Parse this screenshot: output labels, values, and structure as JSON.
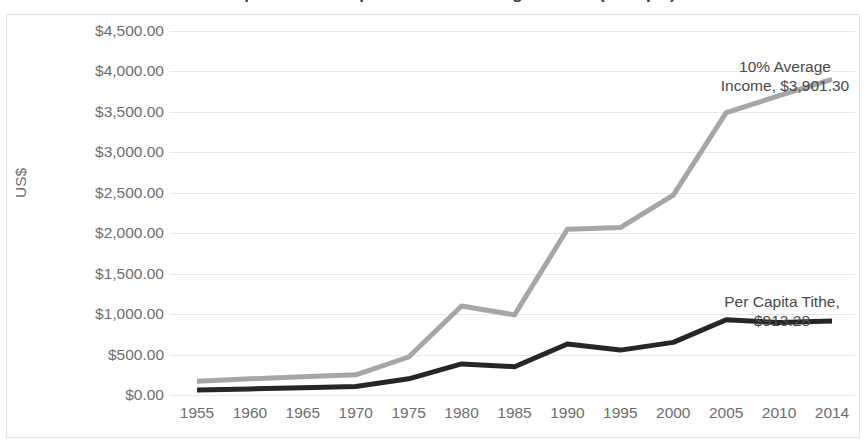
{
  "chart_data": {
    "type": "line",
    "title": "Per Capita Tithe Compared to 10% Average Income (Ethiopia)",
    "xlabel": "",
    "ylabel": "US$",
    "ylim": [
      0,
      4500
    ],
    "ytick_step": 500,
    "grid": true,
    "legend": "none",
    "categories": [
      "1955",
      "1960",
      "1965",
      "1970",
      "1975",
      "1980",
      "1985",
      "1990",
      "1995",
      "2000",
      "2005",
      "2010",
      "2014"
    ],
    "ytick_labels": [
      "$4,500.00",
      "$4,000.00",
      "$3,500.00",
      "$3,000.00",
      "$2,500.00",
      "$2,000.00",
      "$1,500.00",
      "$1,000.00",
      "$500.00",
      "$0.00"
    ],
    "ytick_values": [
      4500,
      4000,
      3500,
      3000,
      2500,
      2000,
      1500,
      1000,
      500,
      0
    ],
    "series": [
      {
        "name": "10% Average Income",
        "color": "#a6a6a6",
        "width": 5,
        "values": [
          170,
          200,
          225,
          250,
          470,
          1100,
          990,
          2050,
          2070,
          2470,
          3490,
          3700,
          3901.3
        ]
      },
      {
        "name": "Per Capita Tithe",
        "color": "#262626",
        "width": 5,
        "values": [
          60,
          75,
          90,
          105,
          200,
          385,
          350,
          630,
          555,
          650,
          930,
          895,
          913.28
        ]
      }
    ],
    "annotations": [
      {
        "name": "high-series-end-label",
        "line1": "10% Average",
        "line2": "Income, $3,901.30",
        "value": 3901.3,
        "at_category": "2014"
      },
      {
        "name": "low-series-end-label",
        "line1": "Per Capita Tithe,",
        "line2": "$913.28",
        "value": 913.28,
        "at_category": "2014"
      }
    ]
  }
}
